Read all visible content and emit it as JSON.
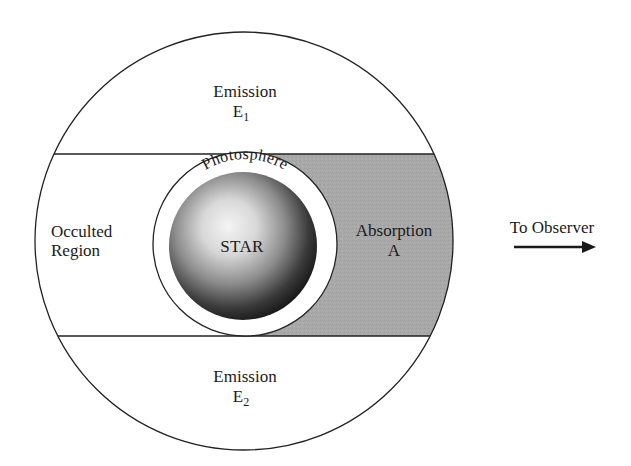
{
  "diagram": {
    "colors": {
      "background": "#ffffff",
      "absorption_fill": "#a9a9a9",
      "line": "#222222",
      "text": "#1a1a1a",
      "star_highlight": "#f2f2f2",
      "star_shadow": "#1e1e1e"
    },
    "regions": {
      "emission_top": {
        "label": "Emission",
        "symbol": "E",
        "subscript": "1"
      },
      "emission_bottom": {
        "label": "Emission",
        "symbol": "E",
        "subscript": "2"
      },
      "occulted": {
        "line1": "Occulted",
        "line2": "Region"
      },
      "absorption": {
        "label": "Absorption",
        "symbol": "A"
      },
      "photosphere": {
        "label": "Photosphere"
      },
      "star": {
        "label": "STAR"
      }
    },
    "observer": {
      "label": "To Observer",
      "icon": "right-arrow-icon"
    }
  }
}
